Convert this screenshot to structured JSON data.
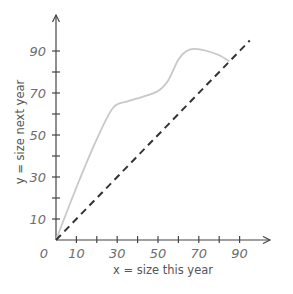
{
  "chart_data": {
    "type": "line",
    "title": "",
    "xlabel": "x = size this year",
    "ylabel": "y = size next year",
    "xlim": [
      0,
      100
    ],
    "ylim": [
      0,
      105
    ],
    "grid": false,
    "legend": "none",
    "origin_label": "0",
    "x_ticks": [
      10,
      20,
      30,
      40,
      50,
      60,
      70,
      80,
      90
    ],
    "x_tick_labels": [
      {
        "value": 10,
        "label": "10"
      },
      {
        "value": 30,
        "label": "30"
      },
      {
        "value": 50,
        "label": "50"
      },
      {
        "value": 70,
        "label": "70"
      },
      {
        "value": 90,
        "label": "90"
      }
    ],
    "y_ticks": [
      10,
      20,
      30,
      40,
      50,
      60,
      70,
      80,
      90
    ],
    "y_tick_labels": [
      {
        "value": 10,
        "label": "10"
      },
      {
        "value": 30,
        "label": "30"
      },
      {
        "value": 50,
        "label": "50"
      },
      {
        "value": 70,
        "label": "70"
      },
      {
        "value": 90,
        "label": "90"
      }
    ],
    "series": [
      {
        "name": "growth-curve",
        "style": "solid",
        "color": "#c8c8c8",
        "x": [
          0,
          10,
          20,
          28,
          35,
          42,
          50,
          55,
          60,
          64,
          68,
          74,
          80,
          85
        ],
        "y": [
          0,
          25,
          48,
          63,
          66,
          68,
          71,
          76,
          86,
          90,
          91,
          90,
          88,
          85
        ]
      },
      {
        "name": "identity-line",
        "style": "dashed",
        "color": "#333333",
        "x": [
          0,
          95
        ],
        "y": [
          0,
          95
        ]
      }
    ]
  },
  "colors": {
    "axis": "#444444",
    "tick_text": "#6e6e6e",
    "label_text": "#555555"
  }
}
